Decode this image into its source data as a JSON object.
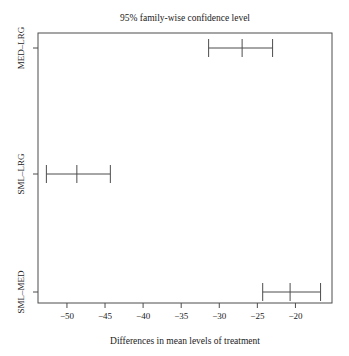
{
  "chart_data": {
    "type": "line",
    "title": "95% family-wise confidence level",
    "xlabel": "Differences in mean levels of treatment",
    "ylabel": "",
    "xlim": [
      -53.8,
      -15.2
    ],
    "grid": false,
    "legend": "none",
    "xticks": [
      -50,
      -45,
      -40,
      -35,
      -30,
      -25,
      -20
    ],
    "xtick_labels": [
      "−50",
      "−45",
      "−40",
      "−35",
      "−30",
      "−25",
      "−20"
    ],
    "categories": [
      "SML-MED",
      "SML-LRG",
      "MED-LRG"
    ],
    "ytick_labels": [
      "SML–MED",
      "SML–LRG",
      "MED–LRG"
    ],
    "intervals": [
      {
        "name": "MED-LRG",
        "lower": -31.4,
        "center": -27.0,
        "upper": -23.0
      },
      {
        "name": "SML-LRG",
        "lower": -52.7,
        "center": -48.7,
        "upper": -44.3
      },
      {
        "name": "SML-MED",
        "lower": -24.3,
        "center": -20.7,
        "upper": -16.7
      }
    ],
    "series": [
      {
        "name": "lower",
        "values": [
          -24.3,
          -52.7,
          -31.4
        ]
      },
      {
        "name": "center",
        "values": [
          -20.7,
          -48.7,
          -27.0
        ]
      },
      {
        "name": "upper",
        "values": [
          -16.7,
          -44.3,
          -23.0
        ]
      }
    ],
    "colors": {
      "line": "#4d4d4d",
      "text": "#1a1a1a",
      "background": "#ffffff"
    }
  }
}
